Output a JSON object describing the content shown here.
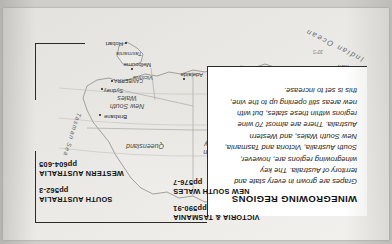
{
  "page": {
    "orientation_degrees": 180,
    "background_color": "#cfcecb",
    "paper_color": "#ffffff"
  },
  "textbox": {
    "title": "WINEGROWING REGIONS",
    "body": "Grapes are grown in every state and territory of Australia. The key winegrowing regions are, however, South Australia, Victoria and Tasmania, New South Wales, and Western Australia. There are almost 70 wine regions within these states, but with new areas still opening up to the vine, this is set to increase."
  },
  "cross_references": [
    {
      "id": "new-south-wales",
      "name": "NEW SOUTH WALES",
      "pages": "pp576-7"
    },
    {
      "id": "victoria-tasmania",
      "name": "VICTORIA & TASMANIA",
      "pages": "pp590-91"
    },
    {
      "id": "south-australia",
      "name": "SOUTH AUSTRALIA",
      "pages": "pp562-3"
    },
    {
      "id": "western-australia",
      "name": "WESTERN AUSTRALIA",
      "pages": "pp604-605"
    }
  ],
  "map": {
    "states": [
      {
        "id": "western-australia",
        "label": "Western\nAustralia"
      },
      {
        "id": "northern-territory",
        "label": "Northern\nTerritory"
      },
      {
        "id": "south-australia",
        "label": "South\nAustralia"
      },
      {
        "id": "queensland",
        "label": "Queensland"
      },
      {
        "id": "new-south-wales",
        "label": "New South\nWales"
      },
      {
        "id": "victoria",
        "label": "Victoria"
      },
      {
        "id": "tasmania",
        "label": "Tasmania"
      }
    ],
    "oceans": [
      {
        "id": "indian-ocean",
        "label": "Indian Ocean"
      },
      {
        "id": "tasman-sea",
        "label": "Tasman Sea"
      }
    ],
    "cities": [
      {
        "id": "darwin",
        "label": "Darwin"
      },
      {
        "id": "brisbane",
        "label": "Brisbane"
      },
      {
        "id": "sydney",
        "label": "Sydney"
      },
      {
        "id": "canberra",
        "label": "CANBERRA"
      },
      {
        "id": "melbourne",
        "label": "Melbourne"
      },
      {
        "id": "adelaide",
        "label": "Adelaide"
      },
      {
        "id": "perth",
        "label": "Perth"
      },
      {
        "id": "hobart",
        "label": "Hobart"
      },
      {
        "id": "margaret-river",
        "label": "Margaret\nRiver"
      }
    ],
    "annotations": [
      {
        "id": "tropic-of-capricorn",
        "label": "Tropic of Capricorn"
      },
      {
        "id": "lat-25s",
        "label": "25°S"
      },
      {
        "id": "lat-35s",
        "label": "35°S"
      },
      {
        "id": "lat-30s",
        "label": "30°S"
      }
    ]
  }
}
